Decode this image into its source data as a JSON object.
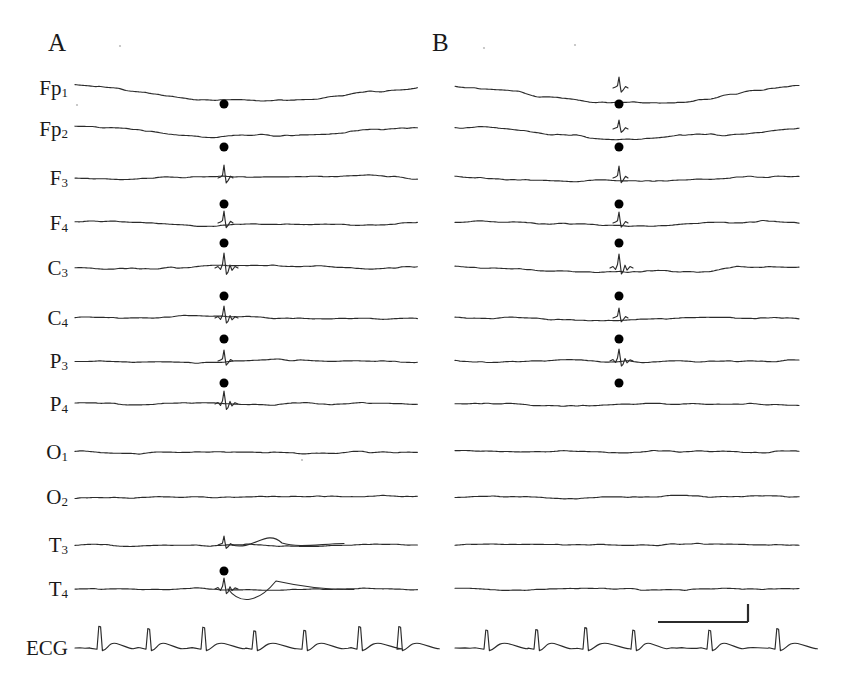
{
  "figure": {
    "kind": "eeg-polygraph-figure",
    "background_color": "#ffffff",
    "trace_color": "#2b2b2b",
    "marker_color": "#000000",
    "panels": [
      {
        "id": "A",
        "letter": "A",
        "x": 48,
        "y": 30,
        "plot_left": 75,
        "plot_right": 416
      },
      {
        "id": "B",
        "letter": "B",
        "x": 432,
        "y": 30,
        "plot_left": 455,
        "plot_right": 799
      }
    ],
    "channel_labels": [
      {
        "base": "Fp",
        "sub": "1",
        "y": 88
      },
      {
        "base": "Fp",
        "sub": "2",
        "y": 129
      },
      {
        "base": "F",
        "sub": "3",
        "y": 178
      },
      {
        "base": "F",
        "sub": "4",
        "y": 223
      },
      {
        "base": "C",
        "sub": "3",
        "y": 268
      },
      {
        "base": "C",
        "sub": "4",
        "y": 318
      },
      {
        "base": "P",
        "sub": "3",
        "y": 361
      },
      {
        "base": "P",
        "sub": "4",
        "y": 404
      },
      {
        "base": "O",
        "sub": "1",
        "y": 452
      },
      {
        "base": "O",
        "sub": "2",
        "y": 497
      },
      {
        "base": "T",
        "sub": "3",
        "y": 545
      },
      {
        "base": "T",
        "sub": "4",
        "y": 589
      },
      {
        "base": "ECG",
        "sub": "",
        "y": 648
      }
    ],
    "label_right_edge": 68,
    "scale_bar": {
      "x1": 658,
      "x2": 748,
      "y_horizontal": 622,
      "y_vertical_top": 604,
      "label_time": "",
      "label_amplitude": "",
      "stroke": "#2b2b2b",
      "stroke_width": 2.2
    },
    "speck_marks": [
      {
        "x": 120,
        "y": 46
      },
      {
        "x": 77,
        "y": 105
      },
      {
        "x": 484,
        "y": 48
      },
      {
        "x": 575,
        "y": 45
      },
      {
        "x": 302,
        "y": 460
      }
    ]
  },
  "chart_data": {
    "type": "line",
    "title": "",
    "subtitle": "",
    "xlabel": "",
    "ylabel": "",
    "grid": false,
    "legend_position": "none",
    "channels": [
      "Fp1",
      "Fp2",
      "F3",
      "F4",
      "C3",
      "C4",
      "P3",
      "P4",
      "O1",
      "O2",
      "T3",
      "T4",
      "ECG"
    ],
    "panels": [
      {
        "name": "A",
        "baselines": [
          88,
          129,
          178,
          223,
          268,
          318,
          361,
          404,
          452,
          497,
          545,
          589,
          648
        ],
        "event_time_x": 224,
        "marked_channels": [
          "Fp1",
          "Fp2",
          "F3",
          "F4",
          "C3",
          "C4",
          "P3",
          "T4"
        ],
        "marker_y": [
          104,
          147,
          204,
          243,
          296,
          339,
          383,
          571
        ],
        "ecg_r_peaks_x": [
          100,
          149,
          204,
          255,
          305,
          360,
          400
        ],
        "ecg_beats": 6
      },
      {
        "name": "B",
        "baselines": [
          88,
          129,
          178,
          223,
          268,
          318,
          361,
          404,
          452,
          497,
          545,
          589,
          648
        ],
        "event_time_x": 619,
        "marked_channels": [
          "Fp1",
          "Fp2",
          "F3",
          "F4",
          "C3",
          "C4",
          "P3"
        ],
        "marker_y": [
          104,
          147,
          204,
          243,
          296,
          339,
          383
        ],
        "ecg_r_peaks_x": [
          487,
          537,
          586,
          634,
          710,
          778
        ],
        "ecg_beats": 6
      }
    ],
    "axis_ranges": {
      "x": [
        0,
        843
      ],
      "y": [
        0,
        688
      ]
    }
  }
}
